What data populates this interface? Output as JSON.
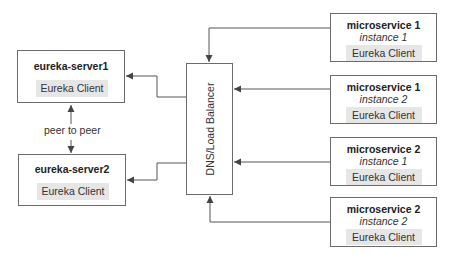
{
  "diagram": {
    "servers": [
      {
        "title": "eureka-server1",
        "client_label": "Eureka Client"
      },
      {
        "title": "eureka-server2",
        "client_label": "Eureka Client"
      }
    ],
    "peer_link_label": "peer to peer",
    "load_balancer": {
      "label": "DNS/Load Balancer"
    },
    "microservices": [
      {
        "title": "microservice 1",
        "instance": "instance 1",
        "client_label": "Eureka Client"
      },
      {
        "title": "microservice 1",
        "instance": "instance 2",
        "client_label": "Eureka Client"
      },
      {
        "title": "microservice 2",
        "instance": "instance 1",
        "client_label": "Eureka Client"
      },
      {
        "title": "microservice 2",
        "instance": "instance 2",
        "client_label": "Eureka Client"
      }
    ],
    "colors": {
      "line": "#555555",
      "box_border": "#6b6b6b",
      "client_fill": "#e6e6e6"
    }
  }
}
